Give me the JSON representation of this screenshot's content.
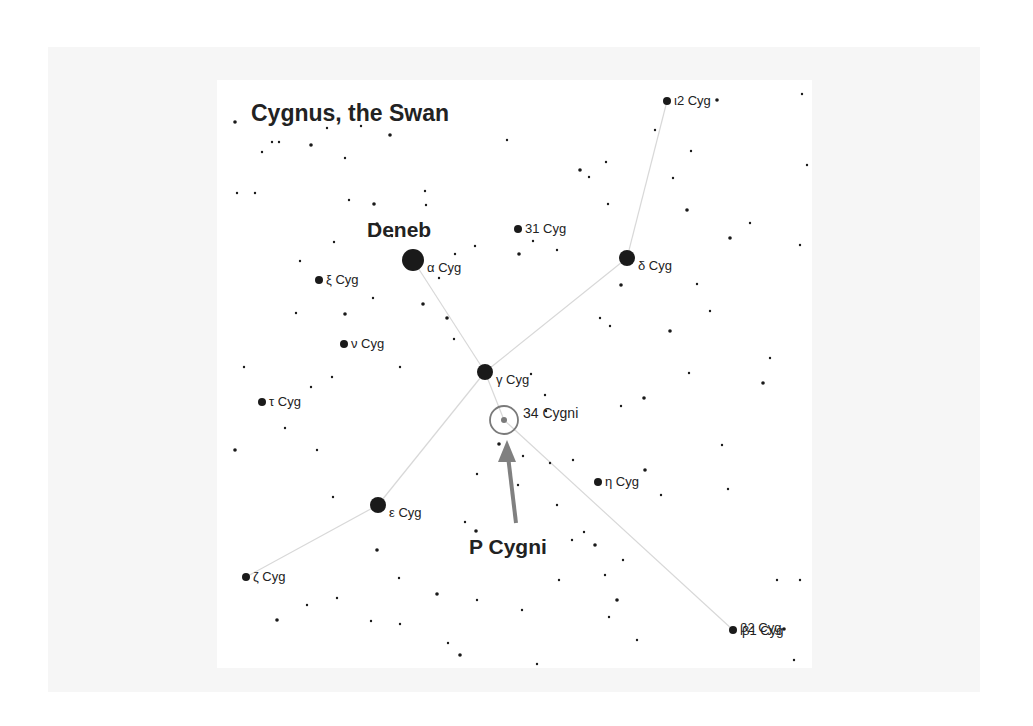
{
  "title": "Cygnus, the Swan",
  "colors": {
    "outer_panel": "#f6f6f6",
    "chart_bg": "#ffffff",
    "star": "#1a1a1a",
    "line": "#d8d8d8",
    "arrow": "#808080",
    "marker": "#7a7a7a"
  },
  "labels": {
    "deneb": "Deneb",
    "p_cygni": "P Cygni",
    "target": "34 Cygni"
  },
  "named_stars": [
    {
      "id": "alpha",
      "label": "α Cyg",
      "x": 196,
      "y": 180,
      "r": 11
    },
    {
      "id": "delta",
      "label": "δ Cyg",
      "x": 410,
      "y": 178,
      "r": 8
    },
    {
      "id": "gamma",
      "label": "γ Cyg",
      "x": 268,
      "y": 292,
      "r": 8
    },
    {
      "id": "epsilon",
      "label": "ε Cyg",
      "x": 161,
      "y": 425,
      "r": 8
    },
    {
      "id": "iota2",
      "label": "ι2 Cyg",
      "x": 450,
      "y": 21,
      "r": 4
    },
    {
      "id": "c31",
      "label": "31 Cyg",
      "x": 301,
      "y": 149,
      "r": 4
    },
    {
      "id": "xi",
      "label": "ξ Cyg",
      "x": 102,
      "y": 200,
      "r": 4
    },
    {
      "id": "nu",
      "label": "ν Cyg",
      "x": 127,
      "y": 264,
      "r": 4
    },
    {
      "id": "tau",
      "label": "τ Cyg",
      "x": 45,
      "y": 322,
      "r": 4
    },
    {
      "id": "eta",
      "label": "η Cyg",
      "x": 381,
      "y": 402,
      "r": 4
    },
    {
      "id": "zeta",
      "label": "ζ Cyg",
      "x": 29,
      "y": 497,
      "r": 4
    },
    {
      "id": "beta",
      "label": "β2 Cyg / β1 Cyg",
      "x": 516,
      "y": 550,
      "r": 4
    }
  ],
  "target": {
    "name": "34 Cygni",
    "x": 287,
    "y": 340,
    "ring_r": 14,
    "dot_r": 3
  },
  "field_stars": [
    [
      18,
      42
    ],
    [
      45,
      72
    ],
    [
      55,
      62
    ],
    [
      62,
      62
    ],
    [
      94,
      65
    ],
    [
      110,
      48
    ],
    [
      128,
      78
    ],
    [
      144,
      46
    ],
    [
      173,
      55
    ],
    [
      20,
      113
    ],
    [
      38,
      113
    ],
    [
      132,
      120
    ],
    [
      157,
      124
    ],
    [
      209,
      125
    ],
    [
      208,
      111
    ],
    [
      290,
      60
    ],
    [
      363,
      90
    ],
    [
      372,
      97
    ],
    [
      389,
      82
    ],
    [
      391,
      124
    ],
    [
      470,
      130
    ],
    [
      474,
      71
    ],
    [
      456,
      98
    ],
    [
      438,
      50
    ],
    [
      500,
      20
    ],
    [
      585,
      14
    ],
    [
      590,
      85
    ],
    [
      583,
      165
    ],
    [
      513,
      158
    ],
    [
      533,
      143
    ],
    [
      480,
      204
    ],
    [
      493,
      231
    ],
    [
      453,
      251
    ],
    [
      472,
      293
    ],
    [
      505,
      365
    ],
    [
      553,
      278
    ],
    [
      546,
      303
    ],
    [
      511,
      409
    ],
    [
      560,
      500
    ],
    [
      583,
      500
    ],
    [
      567,
      549
    ],
    [
      577,
      580
    ],
    [
      537,
      598
    ],
    [
      27,
      287
    ],
    [
      18,
      370
    ],
    [
      68,
      348
    ],
    [
      100,
      370
    ],
    [
      116,
      417
    ],
    [
      160,
      470
    ],
    [
      154,
      541
    ],
    [
      183,
      544
    ],
    [
      231,
      563
    ],
    [
      243,
      575
    ],
    [
      265,
      601
    ],
    [
      320,
      584
    ],
    [
      248,
      442
    ],
    [
      259,
      451
    ],
    [
      356,
      380
    ],
    [
      340,
      425
    ],
    [
      367,
      452
    ],
    [
      378,
      465
    ],
    [
      388,
      495
    ],
    [
      342,
      500
    ],
    [
      406,
      480
    ],
    [
      428,
      390
    ],
    [
      444,
      415
    ],
    [
      314,
      294
    ],
    [
      328,
      315
    ],
    [
      404,
      205
    ],
    [
      393,
      246
    ],
    [
      383,
      238
    ],
    [
      404,
      326
    ],
    [
      427,
      318
    ],
    [
      333,
      383
    ],
    [
      306,
      376
    ],
    [
      260,
      394
    ],
    [
      282,
      364
    ],
    [
      301,
      405
    ],
    [
      329,
      331
    ],
    [
      222,
      198
    ],
    [
      206,
      224
    ],
    [
      183,
      287
    ],
    [
      115,
      297
    ],
    [
      94,
      307
    ],
    [
      230,
      238
    ],
    [
      237,
      259
    ],
    [
      238,
      174
    ],
    [
      258,
      166
    ],
    [
      302,
      174
    ],
    [
      316,
      161
    ],
    [
      340,
      170
    ],
    [
      175,
      156
    ],
    [
      160,
      144
    ],
    [
      117,
      162
    ],
    [
      83,
      181
    ],
    [
      79,
      233
    ],
    [
      128,
      234
    ],
    [
      156,
      218
    ],
    [
      355,
      460
    ],
    [
      392,
      537
    ],
    [
      400,
      520
    ],
    [
      420,
      560
    ],
    [
      305,
      530
    ],
    [
      260,
      520
    ],
    [
      220,
      514
    ],
    [
      182,
      498
    ],
    [
      120,
      518
    ],
    [
      90,
      525
    ],
    [
      60,
      540
    ]
  ],
  "constellation_lines": [
    [
      "alpha",
      "gamma"
    ],
    [
      "gamma",
      "target"
    ],
    [
      "target",
      "beta"
    ],
    [
      "iota2",
      "delta"
    ],
    [
      "delta",
      "gamma"
    ],
    [
      "gamma",
      "epsilon"
    ],
    [
      "epsilon",
      "zeta"
    ]
  ],
  "arrow": {
    "x1": 299,
    "y1": 443,
    "x2": 290,
    "y2": 360
  }
}
